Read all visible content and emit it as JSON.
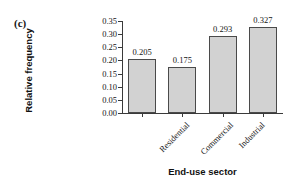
{
  "panel": {
    "label": "(c)"
  },
  "chart_data": {
    "type": "bar",
    "title": "",
    "xlabel": "End-use sector",
    "ylabel": "Relative frequency",
    "categories": [
      "Residential",
      "Commercial",
      "Industrial",
      "Transportation"
    ],
    "values": [
      0.205,
      0.175,
      0.293,
      0.327
    ],
    "value_labels": [
      "0.205",
      "0.175",
      "0.293",
      "0.327"
    ],
    "ylim": [
      0.0,
      0.35
    ],
    "yticks": [
      0.0,
      0.05,
      0.1,
      0.15,
      0.2,
      0.25,
      0.3,
      0.35
    ],
    "ytick_labels": [
      "0.00",
      "0.05",
      "0.10",
      "0.15",
      "0.20",
      "0.25",
      "0.30",
      "0.35"
    ],
    "grid": false,
    "legend": false,
    "bar_color": "#d2d2d2",
    "bar_edge_color": "#4a4a4a",
    "axis_color": "#3a3a3a",
    "background": "#ffffff"
  }
}
